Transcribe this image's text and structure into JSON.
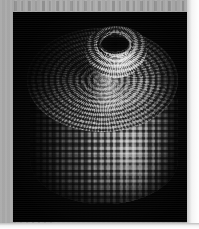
{
  "figure": {
    "domain": "Natural-Image",
    "kind": "scanned-scientific-figure",
    "caption": "",
    "alt_text": "Grayscale rendering of a barrel-shaped cluster of packed spheres with a domed top disc, a raised central turret and a dark central pore",
    "plate": {
      "background_color": "#040404",
      "left": 13,
      "top": 12,
      "width": 174,
      "height": 210
    },
    "scan_page": {
      "paper_color": "#a9a9a9",
      "white_margin_color": "#ffffff",
      "has_ghost_text_top": true,
      "has_ghost_text_bottom": true
    },
    "object": {
      "name": "sphere-packed-barrel",
      "description": "cylindrical particle assembly built from many identical shaded spheres",
      "parts": [
        {
          "id": "lid",
          "label": "top disc of concentric sphere rings"
        },
        {
          "id": "turret",
          "label": "raised central turret"
        },
        {
          "id": "pore",
          "label": "dark central pore"
        },
        {
          "id": "barrel",
          "label": "cylindrical wall of vertical sphere columns"
        },
        {
          "id": "highlight",
          "label": "specular highlight column"
        }
      ],
      "palette": {
        "background": "#040404",
        "sphere_light": "#f0f0f0",
        "sphere_mid": "#8a8a8a",
        "sphere_dark": "#1c1c1c",
        "pore": "#000000"
      },
      "light_direction": "upper-right"
    }
  }
}
